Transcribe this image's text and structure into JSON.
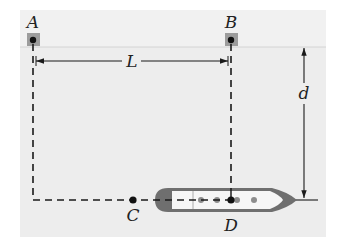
{
  "labels": {
    "A": "A",
    "B": "B",
    "C": "C",
    "D": "D",
    "L": "L",
    "d": "d"
  },
  "colors": {
    "panel": "#ededed",
    "shore_strip": "#f2f2f2",
    "shore_line": "#d6d6d6",
    "post": "#9a9a9a",
    "line": "#1a1a1a",
    "ship_hull": "#6f6f6f",
    "ship_deck": "#f7f7f7",
    "ship_dots": "#8a8a8a"
  },
  "points": {
    "A": {
      "x": 33,
      "y": 41
    },
    "B": {
      "x": 231,
      "y": 41
    },
    "C": {
      "x": 133,
      "y": 200
    },
    "D": {
      "x": 231,
      "y": 200
    }
  },
  "dimensions": {
    "L": {
      "from": "A",
      "to": "B",
      "y": 61
    },
    "d": {
      "x": 304,
      "y_top": 47,
      "y_bottom": 200
    }
  }
}
